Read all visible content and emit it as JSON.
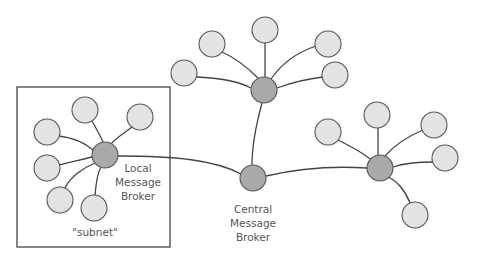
{
  "diagram": {
    "type": "network-topology",
    "colors": {
      "broker_fill": "#a9a9a9",
      "leaf_fill": "#e3e3e3",
      "stroke": "#444444",
      "text": "#555555"
    },
    "subnet_box": {
      "label": "\"subnet\""
    },
    "labels": {
      "local_broker": [
        "Local",
        "Message",
        "Broker"
      ],
      "central_broker": [
        "Central",
        "Message",
        "Broker"
      ]
    },
    "nodes": {
      "local_broker": {
        "role": "broker",
        "x": 105,
        "y": 155
      },
      "central_broker": {
        "role": "broker",
        "x": 253,
        "y": 178
      },
      "top_broker": {
        "role": "broker",
        "x": 264,
        "y": 90
      },
      "right_broker": {
        "role": "broker",
        "x": 380,
        "y": 168
      }
    },
    "clusters": [
      {
        "hub": "local_broker",
        "leaf_count": 6
      },
      {
        "hub": "top_broker",
        "leaf_count": 5
      },
      {
        "hub": "right_broker",
        "leaf_count": 5
      }
    ],
    "connections": [
      [
        "local_broker",
        "central_broker"
      ],
      [
        "top_broker",
        "central_broker"
      ],
      [
        "right_broker",
        "central_broker"
      ]
    ]
  }
}
